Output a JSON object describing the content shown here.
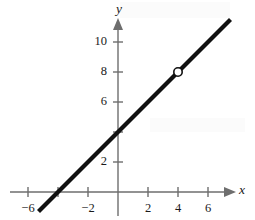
{
  "figure": {
    "title": "",
    "background_color": "#ffffff",
    "width": 255,
    "height": 220
  },
  "axes": {
    "x_label": "x",
    "y_label": "y",
    "axis_color": "#6e6e6e",
    "origin_px": {
      "x": 118,
      "y": 192
    },
    "pixels_per_unit": 15
  },
  "chart_data": {
    "type": "line",
    "title": "",
    "xlabel": "x",
    "ylabel": "y",
    "grid": false,
    "legend": null,
    "xlim": [
      -6.8,
      7.9
    ],
    "ylim": [
      -1.9,
      11.9
    ],
    "x_ticks": [
      -6,
      -4,
      -2,
      2,
      4,
      6
    ],
    "x_tick_labels": [
      "−6",
      "",
      "−2",
      "2",
      "4",
      "6"
    ],
    "y_ticks": [
      2,
      4,
      6,
      8,
      10
    ],
    "y_tick_labels": [
      "2",
      "",
      "6",
      "8",
      "10"
    ],
    "series": [
      {
        "name": "y = x + 4",
        "type": "line",
        "color": "#111111",
        "slope": 1,
        "intercept": 4,
        "x_intercept": -4,
        "y_intercept": 4,
        "x": [
          -5.3,
          7.5
        ],
        "values": [
          -1.3,
          11.5
        ]
      }
    ],
    "annotations": [
      {
        "kind": "open-circle",
        "label": "removable discontinuity",
        "x": 4,
        "y": 8,
        "fill": "#ffffff",
        "stroke": "#111111"
      }
    ]
  }
}
